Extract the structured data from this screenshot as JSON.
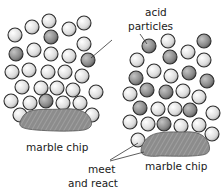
{
  "diagram": {
    "labels": {
      "acid_particles_line1": "acid",
      "acid_particles_line2": "particles",
      "marble_chip_left": "marble chip",
      "marble_chip_right": "marble chip",
      "meet_line1": "meet",
      "meet_line2": "and react"
    },
    "colors": {
      "particle_light": "#e6e6e6",
      "particle_dark": "#8a8a8a",
      "particle_outline": "#333333",
      "marble_fill": "#8c8c8c",
      "text": "#1a1a1a"
    }
  }
}
